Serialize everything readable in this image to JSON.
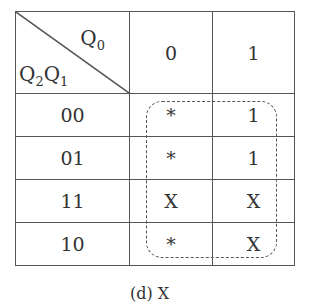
{
  "kmap": {
    "header": {
      "col_var": "Q",
      "col_var_sub": "0",
      "row_var_a": "Q",
      "row_var_a_sub": "2",
      "row_var_b": "Q",
      "row_var_b_sub": "1"
    },
    "columns": [
      "0",
      "1"
    ],
    "rows": [
      {
        "label": "00",
        "cells": [
          "*",
          "1"
        ]
      },
      {
        "label": "01",
        "cells": [
          "*",
          "1"
        ]
      },
      {
        "label": "11",
        "cells": [
          "X",
          "X"
        ]
      },
      {
        "label": "10",
        "cells": [
          "*",
          "X"
        ]
      }
    ],
    "grouping": "dashed loop around all cells of columns 0 and 1"
  },
  "caption": "(d) X"
}
